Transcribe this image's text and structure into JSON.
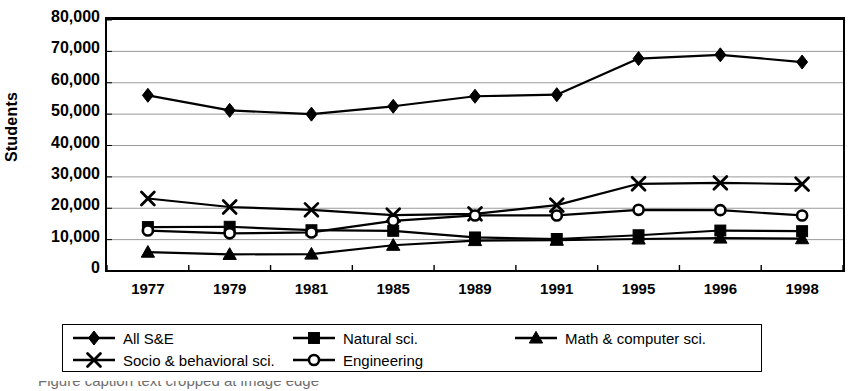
{
  "chart_data": {
    "type": "line",
    "title": "",
    "xlabel": "",
    "ylabel": "Students",
    "categories": [
      "1977",
      "1979",
      "1981",
      "1985",
      "1989",
      "1991",
      "1995",
      "1996",
      "1998"
    ],
    "ylim": [
      0,
      80000
    ],
    "ytick_values": [
      0,
      10000,
      20000,
      30000,
      40000,
      50000,
      60000,
      70000,
      80000
    ],
    "ytick_labels": [
      "0",
      "10,000",
      "20,000",
      "30,000",
      "40,000",
      "50,000",
      "60,000",
      "70,000",
      "80,000"
    ],
    "grid": true,
    "grid_axis": "y",
    "legend_position": "bottom",
    "series": [
      {
        "name": "All S&E",
        "marker": "diamond",
        "color": "#000000",
        "values": [
          56000,
          51200,
          50000,
          52500,
          55700,
          56200,
          67700,
          68900,
          66600
        ]
      },
      {
        "name": "Natural sci.",
        "marker": "square",
        "color": "#000000",
        "values": [
          14000,
          14100,
          13000,
          12800,
          10700,
          10200,
          11400,
          12900,
          12700
        ]
      },
      {
        "name": "Math & computer sci.",
        "marker": "triangle",
        "color": "#000000",
        "values": [
          6000,
          5300,
          5400,
          8200,
          9700,
          9800,
          10200,
          10500,
          10300
        ]
      },
      {
        "name": "Socio & behavioral sci.",
        "marker": "cross",
        "color": "#000000",
        "values": [
          23100,
          20400,
          19500,
          17800,
          18200,
          21000,
          27800,
          28100,
          27700
        ]
      },
      {
        "name": "Engineering",
        "marker": "circle",
        "color": "#000000",
        "values": [
          12900,
          12000,
          12300,
          16000,
          17700,
          17700,
          19500,
          19400,
          17700
        ]
      }
    ]
  },
  "legend": {
    "rows": [
      [
        {
          "label": "All S&E",
          "marker": "diamond"
        },
        {
          "label": "Natural sci.",
          "marker": "square"
        },
        {
          "label": "Math & computer sci.",
          "marker": "triangle"
        }
      ],
      [
        {
          "label": "Socio & behavioral sci.",
          "marker": "cross"
        },
        {
          "label": "Engineering",
          "marker": "circle"
        }
      ]
    ]
  },
  "caption": {
    "partial_text": "Figure caption text cropped at image edge"
  }
}
